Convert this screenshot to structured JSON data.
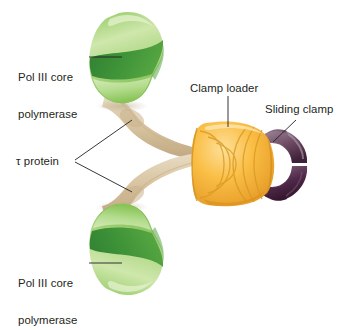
{
  "diagram": {
    "background_color": "#ffffff"
  },
  "labels": {
    "pol3_top": {
      "line1": "Pol III core",
      "line2": "polymerase"
    },
    "pol3_bottom": {
      "line1": "Pol III core",
      "line2": "polymerase"
    },
    "tau": {
      "text": "τ protein"
    },
    "clamp_loader": {
      "text": "Clamp loader"
    },
    "sliding_clamp": {
      "text": "Sliding clamp"
    }
  },
  "components": {
    "pol3_core_top": {
      "name": "Pol III core polymerase",
      "color_light": "#b9dd8f",
      "color_mid": "#86c456",
      "color_dark": "#3f8f3a"
    },
    "pol3_core_bottom": {
      "name": "Pol III core polymerase",
      "color_light": "#b9dd8f",
      "color_mid": "#86c456",
      "color_dark": "#3f8f3a"
    },
    "tau_protein_upper": {
      "name": "τ protein",
      "color": "#d8c3a0"
    },
    "tau_protein_lower": {
      "name": "τ protein",
      "color": "#d8c3a0"
    },
    "clamp_loader": {
      "name": "Clamp loader",
      "color_light": "#fbd06a",
      "color_mid": "#f5b02f",
      "color_dark": "#dc8f1c"
    },
    "sliding_clamp": {
      "name": "Sliding clamp",
      "color_light": "#9b8194",
      "color_dark": "#4b2a42"
    }
  },
  "leader_lines": {
    "color": "#231f20",
    "pol3_top": "horizontal",
    "pol3_bottom": "horizontal",
    "tau": "branched",
    "clamp_loader": "vertical",
    "sliding_clamp": "diagonal"
  }
}
